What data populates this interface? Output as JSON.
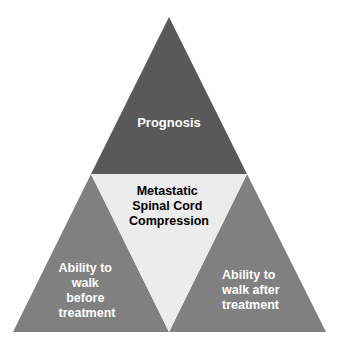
{
  "diagram": {
    "type": "medial-triangle",
    "background_color": "#ffffff",
    "geometry": {
      "apex": [
        169,
        17
      ],
      "base_left": [
        13,
        332
      ],
      "base_right": [
        326,
        332
      ],
      "mid_left": [
        91,
        174
      ],
      "mid_right": [
        247,
        174
      ],
      "mid_base": [
        169,
        332
      ]
    },
    "segments": [
      {
        "id": "top",
        "name": "prognosis",
        "fill": "#595959",
        "text_color": "#ffffff",
        "lines": [
          "Prognosis"
        ],
        "text_anchor": "middle"
      },
      {
        "id": "center",
        "name": "metastatic-spinal-cord-compression",
        "fill": "#ececec",
        "text_color": "#000000",
        "lines": [
          "Metastatic",
          "Spinal Cord",
          "Compression"
        ],
        "text_anchor": "middle"
      },
      {
        "id": "bottom-left",
        "name": "ability-to-walk-before-treatment",
        "fill": "#808080",
        "text_color": "#ffffff",
        "lines": [
          "Ability to",
          "walk",
          "before",
          "treatment"
        ],
        "text_anchor": "middle"
      },
      {
        "id": "bottom-right",
        "name": "ability-to-walk-after-treatment",
        "fill": "#808080",
        "text_color": "#ffffff",
        "lines": [
          "Ability to",
          "walk after",
          "treatment"
        ],
        "text_anchor": "start"
      }
    ]
  }
}
